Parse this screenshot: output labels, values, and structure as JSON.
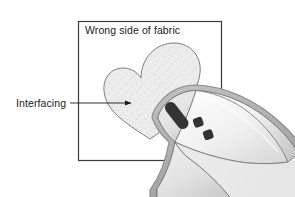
{
  "figure": {
    "type": "instructional-diagram",
    "background_color": "#ffffff"
  },
  "labels": {
    "fabric_label": "Wrong side of fabric",
    "interfacing_label": "Interfacing"
  },
  "colors": {
    "fabric_outline": "#3b3b3b",
    "fabric_fill": "#ffffff",
    "interfacing_fill": "#ebebeb",
    "interfacing_outline": "#6b6b6b",
    "speckle": "#9a9a9a",
    "iron_band": "#b4b4b4",
    "iron_band_outline": "#8a8a8a",
    "iron_body_light": "#fdfdfd",
    "iron_body_shade": "#d2d2d2",
    "iron_marking": "#333333",
    "leader_line": "#1b1b1b",
    "text": "#1b1b1b"
  },
  "elements": {
    "fabric_square": {
      "name": "fabric-square",
      "x": 78,
      "y": 21,
      "width": 144,
      "height": 140
    },
    "interfacing_heart": {
      "name": "interfacing-heart",
      "center_x": 150,
      "center_y": 90,
      "speckled": true
    },
    "iron": {
      "name": "iron",
      "orientation": "tip-pointing-left",
      "markings": [
        {
          "name": "iron-marking-pill",
          "shape": "rounded-pill"
        },
        {
          "name": "iron-marking-square-upper",
          "shape": "rounded-square"
        },
        {
          "name": "iron-marking-square-lower",
          "shape": "rounded-square"
        }
      ]
    },
    "leader": {
      "name": "interfacing-leader-line",
      "from_x": 70,
      "to_x": 133,
      "y": 103,
      "arrowhead": true
    }
  }
}
